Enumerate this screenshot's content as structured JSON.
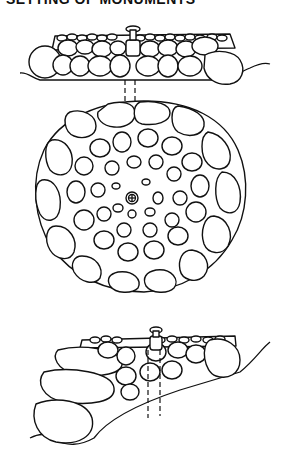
{
  "title": "SETTING OF MONUMENTS",
  "figures": [
    {
      "name": "elevation-view",
      "label": "Cairn with monument, side elevation"
    },
    {
      "name": "plan-view",
      "label": "Cairn with monument, plan view"
    },
    {
      "name": "slope-view",
      "label": "Cairn with monument on slope"
    }
  ],
  "colors": {
    "ink": "#111111",
    "paper": "#ffffff"
  }
}
